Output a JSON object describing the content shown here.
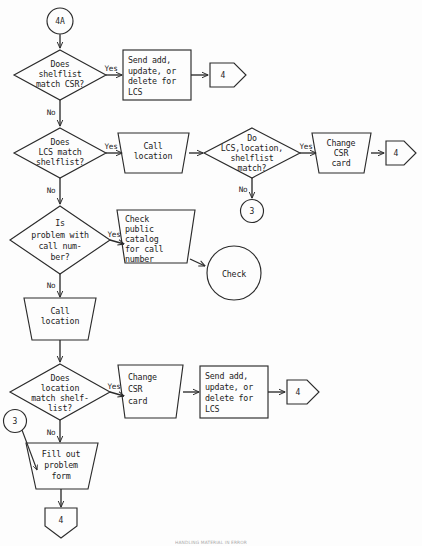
{
  "diagram": {
    "stroke_color": "#2b2b2b",
    "background_color": "#fdfdfd",
    "footer_note": "HANDLING MATERIAL IN ERROR"
  },
  "nodes": {
    "start_connector": {
      "label": "4A",
      "shape": "circle"
    },
    "decision_shelflist_csr": {
      "label": "Does\nshelflist\nmatch CSR?",
      "lines": [
        "Does",
        "shelflist",
        "match CSR?"
      ],
      "shape": "diamond"
    },
    "process_send_lcs_top": {
      "lines": [
        "Send add,",
        "update, or",
        "delete for",
        "LCS"
      ],
      "shape": "rectangle"
    },
    "connector_4_top": {
      "label": "4",
      "shape": "pentagon-right"
    },
    "decision_lcs_shelflist": {
      "lines": [
        "Does",
        "LCS match",
        "shelflist?"
      ],
      "shape": "diamond"
    },
    "manual_call_location_top": {
      "lines": [
        "Call",
        "location"
      ],
      "shape": "trapezoid"
    },
    "decision_lcs_location_shelflist": {
      "lines": [
        "Do",
        "LCS,location,",
        "shelflist",
        "match?"
      ],
      "shape": "diamond"
    },
    "manual_change_csr_top": {
      "lines": [
        "Change",
        "CSR",
        "card"
      ],
      "shape": "trapezoid"
    },
    "connector_4_row2": {
      "label": "4",
      "shape": "pentagon-right"
    },
    "connector_3_row2": {
      "label": "3",
      "shape": "circle"
    },
    "decision_call_number": {
      "lines": [
        "Is",
        "problem with",
        "call num-",
        "ber?"
      ],
      "shape": "diamond"
    },
    "manual_check_catalog": {
      "lines": [
        "Check",
        "public",
        "catalog",
        "for call",
        "number"
      ],
      "shape": "trapezoid"
    },
    "terminator_check": {
      "label": "Check",
      "shape": "circle"
    },
    "manual_call_location_mid": {
      "lines": [
        "Call",
        "location"
      ],
      "shape": "trapezoid"
    },
    "decision_location_shelflist": {
      "lines": [
        "Does",
        "location",
        "match shelf-",
        "list?"
      ],
      "shape": "diamond"
    },
    "manual_change_csr_bottom": {
      "lines": [
        "Change",
        "CSR",
        "card"
      ],
      "shape": "trapezoid"
    },
    "process_send_lcs_bottom": {
      "lines": [
        "Send add,",
        "update, or",
        "delete for",
        "LCS"
      ],
      "shape": "rectangle"
    },
    "connector_4_row3": {
      "label": "4",
      "shape": "pentagon-right"
    },
    "connector_3_bottom": {
      "label": "3",
      "shape": "circle"
    },
    "manual_fill_problem_form": {
      "lines": [
        "Fill out",
        "problem",
        "form"
      ],
      "shape": "trapezoid"
    },
    "connector_4_end": {
      "label": "4",
      "shape": "pentagon-down"
    }
  },
  "edge_labels": {
    "yes_1": "Yes",
    "no_1": "No",
    "yes_2": "Yes",
    "no_2": "No",
    "yes_3": "Yes",
    "no_3": "No",
    "yes_4": "Yes",
    "no_4": "No",
    "yes_5": "Yes",
    "no_5": "No"
  }
}
